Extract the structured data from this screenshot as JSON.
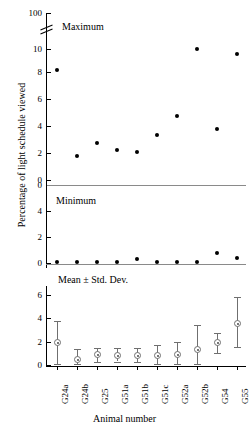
{
  "chart_data": {
    "type": "scatter",
    "title": "",
    "xlabel": "Animal number",
    "ylabel": "Percentage of light schedule viewed",
    "categories": [
      "G24a",
      "G24b",
      "G25",
      "G51a",
      "G51b",
      "G51c",
      "G52a",
      "G52b",
      "G54",
      "G55"
    ],
    "grid": false,
    "legend": null,
    "panels": [
      {
        "name": "maximum",
        "annotation": "Maximum",
        "ylim": [
          0,
          10
        ],
        "yticks": [
          0,
          2,
          4,
          6,
          8,
          10
        ],
        "axis_break": true,
        "axis_break_top_tick": 100,
        "marker": "filled-circle",
        "values": [
          8.4,
          1.8,
          2.8,
          2.3,
          2.15,
          3.4,
          4.85,
          10.0,
          3.9,
          9.6
        ]
      },
      {
        "name": "minimum",
        "annotation": "Minimum",
        "ylim": [
          0,
          5
        ],
        "yticks": [
          0,
          2,
          4
        ],
        "reversed": true,
        "marker": "filled-circle",
        "values": [
          0.08,
          0.08,
          0.08,
          0.08,
          0.3,
          0.08,
          0.08,
          0.08,
          0.8,
          0.35
        ]
      },
      {
        "name": "mean-std-dev",
        "annotation": "Mean ± Std. Dev.",
        "ylim": [
          0,
          7
        ],
        "yticks": [
          0,
          2,
          4,
          6
        ],
        "marker": "open-circle-with-dot",
        "means": [
          1.95,
          0.45,
          0.9,
          0.85,
          0.85,
          0.8,
          0.9,
          1.3,
          1.9,
          3.6
        ],
        "err_low": [
          0.05,
          0.05,
          0.3,
          0.3,
          0.25,
          0.05,
          0.05,
          0.05,
          1.05,
          1.55
        ],
        "err_high": [
          3.75,
          1.35,
          1.5,
          1.45,
          1.45,
          1.75,
          2.0,
          3.45,
          2.75,
          5.8
        ]
      }
    ]
  },
  "ticks": {
    "top_panel": [
      "100",
      "10",
      "8",
      "6",
      "4",
      "2",
      "0"
    ],
    "mid_panel": [
      "0",
      "4",
      "2",
      "0"
    ],
    "bottom_panel": [
      "6",
      "4",
      "2",
      "0"
    ]
  },
  "annotations": {
    "maximum": "Maximum",
    "minimum": "Minimum",
    "mean_std": "Mean ± Std. Dev."
  },
  "axes": {
    "x_title": "Animal number",
    "y_title": "Percentage of light schedule viewed"
  }
}
